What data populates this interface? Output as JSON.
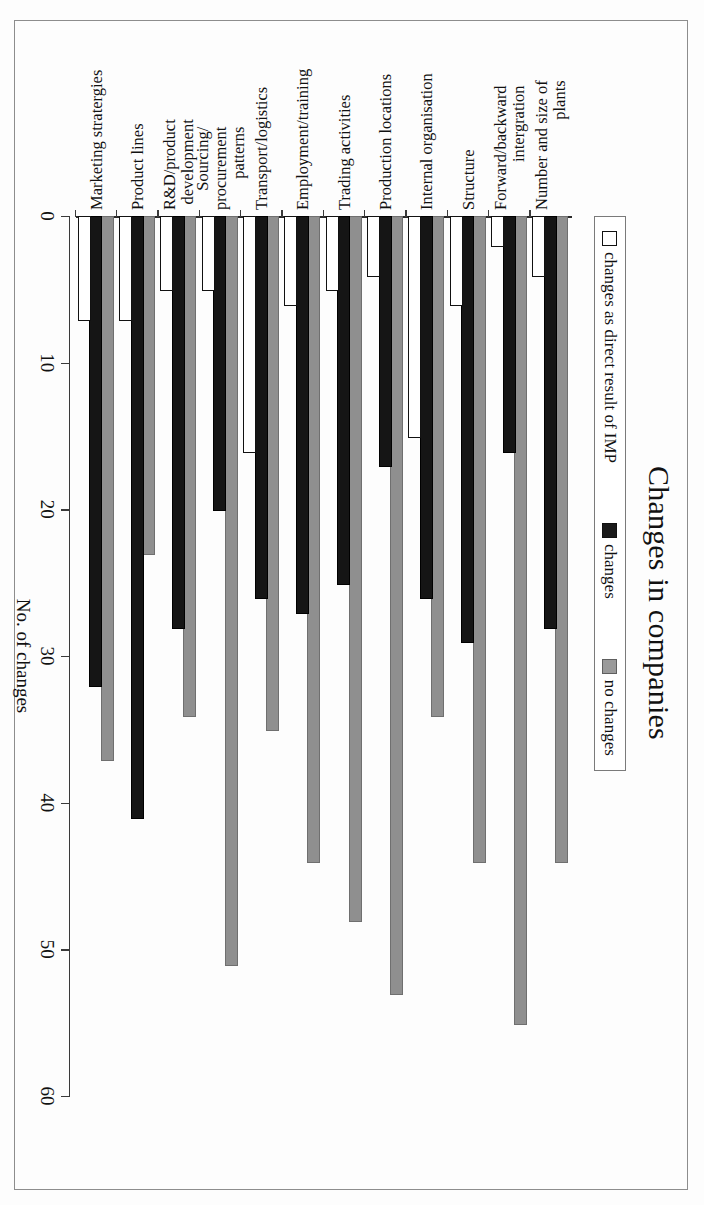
{
  "figure": {
    "title": "Changes in companies",
    "axis_label": "No. of changes"
  },
  "legend": {
    "position": "top",
    "items": [
      {
        "label": "changes as direct result of IMP",
        "key": "direct",
        "color": "#ffffff",
        "swatch": "outline-square-icon"
      },
      {
        "label": "changes",
        "key": "changes",
        "color": "#151515",
        "swatch": "filled-black-square-icon"
      },
      {
        "label": "no changes",
        "key": "nochanges",
        "color": "#8f8f8f",
        "swatch": "filled-gray-square-icon"
      }
    ]
  },
  "axis": {
    "ticks": [
      "0",
      "10",
      "20",
      "30",
      "40",
      "50",
      "60"
    ],
    "min": 0,
    "max": 60,
    "step": 10
  },
  "chart_data": {
    "type": "bar",
    "orientation": "horizontal",
    "title": "Changes in companies",
    "xlabel": "No. of changes",
    "ylabel": "",
    "xlim": [
      0,
      60
    ],
    "grid": false,
    "legend_position": "top",
    "categories": [
      "Number and size of\nplants",
      "Forward/backward\nintergration",
      "Structure",
      "Internal organisation",
      "Production locations",
      "Trading activities",
      "Employment/training",
      "Transport/logistics",
      "Sourcing/\nprocurement\npatterns",
      "R&D/product\ndevelopment",
      "Product lines",
      "Marketing stratergies"
    ],
    "series": [
      {
        "name": "changes as direct result of IMP",
        "color": "#ffffff",
        "values": [
          4,
          2,
          6,
          15,
          4,
          5,
          6,
          16,
          5,
          5,
          7,
          7
        ]
      },
      {
        "name": "changes",
        "color": "#151515",
        "values": [
          28,
          16,
          29,
          26,
          17,
          25,
          27,
          26,
          20,
          28,
          41,
          32
        ]
      },
      {
        "name": "no changes",
        "color": "#8f8f8f",
        "values": [
          44,
          55,
          44,
          34,
          53,
          48,
          44,
          35,
          51,
          34,
          23,
          37
        ]
      }
    ]
  }
}
